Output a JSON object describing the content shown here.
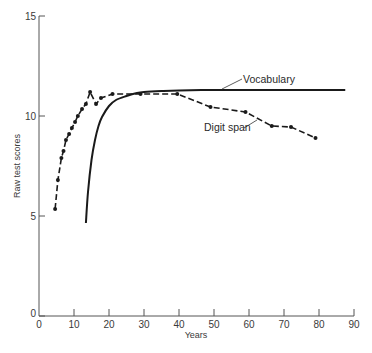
{
  "chart_data": {
    "type": "line",
    "title": "",
    "xlabel": "Years",
    "ylabel": "Raw test scores",
    "xlim": [
      0,
      90
    ],
    "ylim": [
      0,
      15
    ],
    "xticks": [
      0,
      10,
      20,
      30,
      40,
      50,
      60,
      70,
      80,
      90
    ],
    "yticks": [
      0,
      5,
      10,
      15
    ],
    "grid": false,
    "legend": "inline labels",
    "series": [
      {
        "name": "Vocabulary",
        "style": "solid",
        "markers": false,
        "x": [
          13.4,
          14,
          15,
          16,
          17,
          18,
          20,
          22,
          25,
          28,
          30,
          35,
          40,
          50,
          60,
          70,
          80,
          87.5
        ],
        "y": [
          4.65,
          6.2,
          7.8,
          8.8,
          9.5,
          9.95,
          10.5,
          10.8,
          11.0,
          11.15,
          11.2,
          11.25,
          11.28,
          11.3,
          11.3,
          11.3,
          11.3,
          11.3
        ]
      },
      {
        "name": "Digit span",
        "style": "dashed",
        "markers": true,
        "x": [
          4.6,
          5.4,
          6.4,
          7.0,
          7.7,
          8.6,
          9.4,
          10.3,
          11.1,
          12.3,
          13.4,
          14.6,
          16.3,
          17.7,
          21,
          29,
          39.5,
          49,
          59,
          66.5,
          72,
          79
        ],
        "y": [
          5.35,
          6.8,
          7.9,
          8.25,
          8.8,
          9.1,
          9.4,
          9.7,
          10.0,
          10.35,
          10.6,
          11.2,
          10.6,
          10.9,
          11.1,
          11.1,
          11.1,
          10.45,
          10.2,
          9.5,
          9.45,
          8.9
        ]
      }
    ],
    "annotations": [
      {
        "text": "Vocabulary",
        "x": 58,
        "y": 11.8
      },
      {
        "text": "Digit span",
        "x": 47,
        "y": 9.4
      }
    ]
  },
  "labels": {
    "vocabulary": "Vocabulary",
    "digit_span": "Digit span",
    "xlabel": "Years",
    "ylabel": "Raw test scores"
  }
}
